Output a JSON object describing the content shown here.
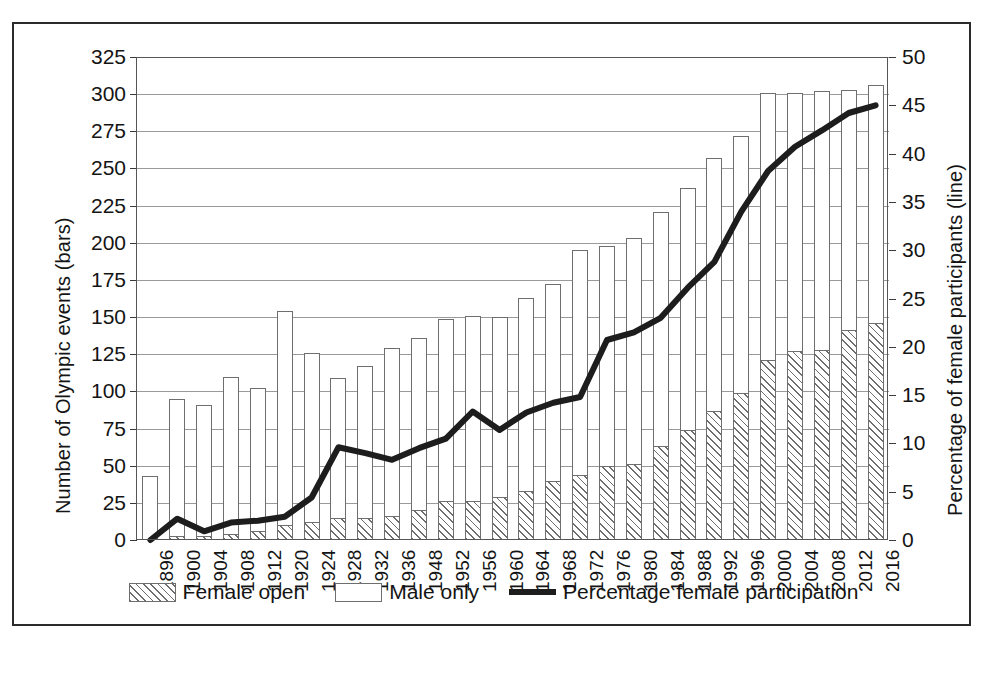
{
  "chart_data": {
    "type": "bar",
    "title": "",
    "xlabel": "",
    "ylabel": "Number of Olympic events (bars)",
    "ylabel_right": "Percentage of female participants (line)",
    "grid": true,
    "legend_position": "bottom",
    "ylim": [
      0,
      325
    ],
    "ylim_right": [
      0,
      50
    ],
    "yticks": [
      0,
      25,
      50,
      75,
      100,
      125,
      150,
      175,
      200,
      225,
      250,
      275,
      300,
      325
    ],
    "yticks_right": [
      0,
      5,
      10,
      15,
      20,
      25,
      30,
      35,
      40,
      45,
      50
    ],
    "categories": [
      "1896",
      "1900",
      "1904",
      "1908",
      "1912",
      "1920",
      "1924",
      "1928",
      "1932",
      "1936",
      "1948",
      "1952",
      "1956",
      "1960",
      "1964",
      "1968",
      "1972",
      "1976",
      "1980",
      "1984",
      "1988",
      "1992",
      "1996",
      "2000",
      "2004",
      "2008",
      "2012",
      "2016"
    ],
    "series": [
      {
        "name": "Female open",
        "type": "bar",
        "stack": "events",
        "axis": "left",
        "values": [
          0,
          3,
          3,
          4,
          6,
          10,
          12,
          15,
          15,
          16,
          20,
          26,
          26,
          29,
          33,
          40,
          44,
          50,
          51,
          63,
          74,
          87,
          99,
          121,
          127,
          128,
          141,
          146
        ]
      },
      {
        "name": "Male only",
        "type": "bar",
        "stack": "events",
        "axis": "left",
        "values": [
          43,
          92,
          88,
          106,
          96,
          144,
          114,
          94,
          102,
          113,
          116,
          123,
          125,
          121,
          130,
          132,
          151,
          148,
          152,
          158,
          163,
          170,
          173,
          180,
          174,
          174,
          162,
          160
        ]
      },
      {
        "name": "Percentage female participation",
        "type": "line",
        "axis": "right",
        "values": [
          0.0,
          2.2,
          0.9,
          1.8,
          2.0,
          2.4,
          4.4,
          9.6,
          9.0,
          8.3,
          9.5,
          10.5,
          13.3,
          11.4,
          13.2,
          14.2,
          14.8,
          20.7,
          21.5,
          23.0,
          26.1,
          28.8,
          34.0,
          38.2,
          40.7,
          42.4,
          44.2,
          45.0
        ]
      }
    ],
    "bar_totals": [
      43,
      95,
      91,
      110,
      102,
      154,
      126,
      109,
      117,
      129,
      136,
      149,
      151,
      150,
      163,
      172,
      195,
      198,
      203,
      221,
      237,
      257,
      272,
      301,
      301,
      302,
      303,
      306
    ],
    "legend": [
      {
        "label": "Female open",
        "marker": "hatched-rectangle"
      },
      {
        "label": "Male only",
        "marker": "open-rectangle"
      },
      {
        "label": "Percentage female participation",
        "marker": "thick-black-line"
      }
    ],
    "colors": {
      "bar_outline": "#6e6e6e",
      "bar_fill": "#ffffff",
      "hatch": "#6e6e6e",
      "line": "#1d1d1d",
      "grid": "#9a9a9a",
      "axis": "#3a3a3a",
      "text": "#141414"
    }
  },
  "caption": {
    "text": ""
  }
}
